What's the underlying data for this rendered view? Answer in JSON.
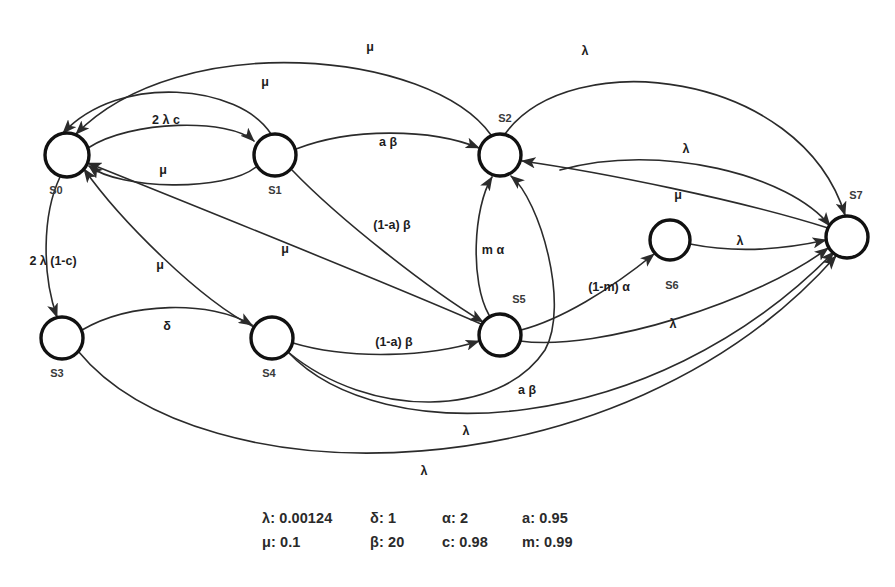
{
  "diagram": {
    "background_color": "#ffffff",
    "node_stroke_color": "#111111",
    "edge_stroke_color": "#2b2b2b",
    "nodes": [
      {
        "id": "S0",
        "label": "S0",
        "cx": 67,
        "cy": 155,
        "r": 22,
        "label_x": 56,
        "label_y": 191
      },
      {
        "id": "S1",
        "label": "S1",
        "cx": 275,
        "cy": 155,
        "r": 21,
        "label_x": 275,
        "label_y": 191
      },
      {
        "id": "S2",
        "label": "S2",
        "cx": 500,
        "cy": 155,
        "r": 21,
        "label_x": 505,
        "label_y": 119
      },
      {
        "id": "S3",
        "label": "S3",
        "cx": 62,
        "cy": 338,
        "r": 21,
        "label_x": 57,
        "label_y": 374
      },
      {
        "id": "S4",
        "label": "S4",
        "cx": 272,
        "cy": 338,
        "r": 21,
        "label_x": 269,
        "label_y": 374
      },
      {
        "id": "S5",
        "label": "S5",
        "cx": 500,
        "cy": 335,
        "r": 21,
        "label_x": 519,
        "label_y": 300
      },
      {
        "id": "S6",
        "label": "S6",
        "cx": 670,
        "cy": 240,
        "r": 20,
        "label_x": 672,
        "label_y": 286
      },
      {
        "id": "S7",
        "label": "S7",
        "cx": 847,
        "cy": 237,
        "r": 21,
        "label_x": 856,
        "label_y": 196
      }
    ],
    "edges": [
      {
        "id": "e-s0-s1",
        "from": "S0",
        "to": "S1",
        "label": "2 λ c",
        "label_x": 166,
        "label_y": 121,
        "path": "M 88 148 C 130 120 230 118 254 141"
      },
      {
        "id": "e-s1-s0",
        "from": "S1",
        "to": "S0",
        "label": "μ",
        "label_x": 163,
        "label_y": 171,
        "path": "M 256 167 C 225 192 120 190 89 166"
      },
      {
        "id": "e-s0-s3",
        "from": "S0",
        "to": "S3",
        "label": "2 λ (1-c)",
        "label_x": 53,
        "label_y": 262,
        "path": "M 60 177 C 42 215 42 275 57 317"
      },
      {
        "id": "e-s3-s4",
        "from": "S3",
        "to": "S4",
        "label": "δ",
        "label_x": 167,
        "label_y": 327,
        "path": "M 82 330 C 130 302 210 300 252 325"
      },
      {
        "id": "e-s1-s2",
        "from": "S1",
        "to": "S2",
        "label": "a β",
        "label_x": 388,
        "label_y": 143,
        "path": "M 296 149 C 350 128 430 128 479 148"
      },
      {
        "id": "e-s1-s5",
        "from": "S1",
        "to": "S5",
        "label": "(1-a) β",
        "label_x": 392,
        "label_y": 226,
        "path": "M 292 170 C 340 220 430 290 483 322"
      },
      {
        "id": "e-s4-s5",
        "from": "S4",
        "to": "S5",
        "label": "(1-a) β",
        "label_x": 394,
        "label_y": 343,
        "path": "M 293 343 C 350 360 430 357 479 341"
      },
      {
        "id": "e-s5-s2",
        "from": "S5",
        "to": "S2",
        "label": "m α",
        "label_x": 493,
        "label_y": 251,
        "path": "M 489 315 C 470 282 473 208 492 177"
      },
      {
        "id": "e-s4-s2",
        "from": "S4",
        "to": "S2",
        "label": "a β",
        "label_x": 527,
        "label_y": 391,
        "path": "M 288 352 C 370 420 500 418 545 350 C 570 305 540 200 511 176"
      },
      {
        "id": "e-s5-s6",
        "from": "S5",
        "to": "S6",
        "label": "(1-m) α",
        "label_x": 609,
        "label_y": 288,
        "path": "M 521 330 C 560 320 610 290 654 254"
      },
      {
        "id": "e-s2-s0-a",
        "from": "S2",
        "to": "S0",
        "label": "μ",
        "label_x": 370,
        "label_y": 48,
        "path": "M 491 135 C 430 50 180 28 76 134"
      },
      {
        "id": "e-s1-s0-b",
        "from": "S1",
        "to": "S0",
        "label": "μ",
        "label_x": 265,
        "label_y": 83,
        "path": "M 271 134 C 240 85 120 72 63 133"
      },
      {
        "id": "e-s2-s7",
        "from": "S2",
        "to": "S7",
        "label": "λ",
        "label_x": 585,
        "label_y": 52,
        "path": "M 505 134 C 570 44 800 70 845 215"
      },
      {
        "id": "e-s6-s7",
        "from": "S6",
        "to": "S7",
        "label": "λ",
        "label_x": 686,
        "label_y": 150,
        "path": "M 560 170 C 660 142 790 175 830 226"
      },
      {
        "id": "e-s7-s2",
        "from": "S7",
        "to": "S2",
        "label": "μ",
        "label_x": 678,
        "label_y": 196,
        "path": "M 828 228 C 740 200 600 172 522 161"
      },
      {
        "id": "e-s6-s7b",
        "from": "S6",
        "to": "S7",
        "label": "λ",
        "label_x": 740,
        "label_y": 242,
        "path": "M 690 244 C 740 254 790 248 826 240"
      },
      {
        "id": "e-s5-s7",
        "from": "S5",
        "to": "S7",
        "label": "λ",
        "label_x": 673,
        "label_y": 325,
        "path": "M 520 341 C 600 352 760 300 828 248"
      },
      {
        "id": "e-s4-s7",
        "from": "S4",
        "to": "S7",
        "label": "λ",
        "label_x": 466,
        "label_y": 432,
        "path": "M 288 352 C 380 450 650 440 834 252"
      },
      {
        "id": "e-s3-s7",
        "from": "S3",
        "to": "S7",
        "label": "λ",
        "label_x": 424,
        "label_y": 472,
        "path": "M 78 351 C 200 500 620 500 836 256"
      },
      {
        "id": "e-s5-s0",
        "from": "S5",
        "to": "S0",
        "label": "μ",
        "label_x": 285,
        "label_y": 250,
        "path": "M 481 324 C 380 280 180 200 88 163"
      },
      {
        "id": "e-s4-s0",
        "from": "S4",
        "to": "S0",
        "label": "μ",
        "label_x": 160,
        "label_y": 266,
        "path": "M 254 327 C 200 300 120 220 84 169"
      }
    ],
    "legend": {
      "rows": [
        [
          "λ: 0.00124",
          "δ: 1",
          "α: 2",
          "a: 0.95"
        ],
        [
          "μ: 0.1",
          "β: 20",
          "c: 0.98",
          "m: 0.99"
        ]
      ]
    }
  }
}
